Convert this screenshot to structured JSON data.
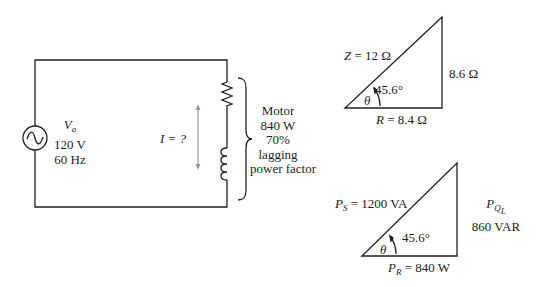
{
  "circuit": {
    "source": {
      "symbol": "V",
      "subscript": "a",
      "voltage": "120 V",
      "frequency": "60 Hz"
    },
    "current_label": "I = ?",
    "motor": {
      "lines": [
        "Motor",
        "840 W",
        "70%",
        "lagging",
        "power factor"
      ]
    }
  },
  "impedance_triangle": {
    "hypotenuse": {
      "symbol": "Z",
      "value": "= 12 Ω"
    },
    "vertical": "8.6 Ω",
    "base": {
      "symbol": "R",
      "value": "= 8.4 Ω"
    },
    "angle_symbol": "θ",
    "angle": "45.6°"
  },
  "power_triangle": {
    "hypotenuse": {
      "symbol": "P",
      "subscript": "S",
      "value": "= 1200 VA"
    },
    "vertical": {
      "symbol": "P",
      "subscript": "Q",
      "sub_subscript": "L",
      "value": "860 VAR"
    },
    "base": {
      "symbol": "P",
      "subscript": "R",
      "value": "= 840 W"
    },
    "angle_symbol": "θ",
    "angle": "45.6°"
  }
}
